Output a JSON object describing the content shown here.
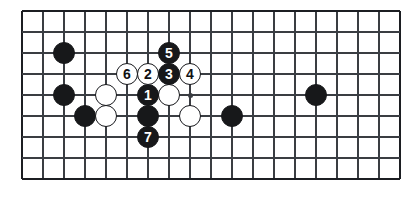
{
  "figure": {
    "kind": "go-board-diagram",
    "background_color": "#ffffff",
    "line_color": "#3a3d42",
    "border_color": "#1c1e22",
    "black_stone_color": "#17181a",
    "white_stone_color": "#ffffff",
    "black_number_color": "#ffffff",
    "white_number_color": "#101114"
  },
  "board": {
    "columns": 19,
    "rows": 9,
    "origin_x": 22,
    "origin_y": 11,
    "spacing": 21,
    "stone_diameter": 22,
    "star_points": [
      {
        "col": 9,
        "row": 5
      }
    ]
  },
  "stones": [
    {
      "id": "stone-black-a",
      "color": "black",
      "col": 3,
      "row": 3,
      "label": ""
    },
    {
      "id": "stone-black-b",
      "color": "black",
      "col": 3,
      "row": 5,
      "label": ""
    },
    {
      "id": "stone-black-c",
      "color": "black",
      "col": 4,
      "row": 6,
      "label": ""
    },
    {
      "id": "stone-white-a",
      "color": "white",
      "col": 5,
      "row": 5,
      "label": ""
    },
    {
      "id": "stone-white-b",
      "color": "white",
      "col": 5,
      "row": 6,
      "label": ""
    },
    {
      "id": "stone-white-c",
      "color": "white",
      "col": 8,
      "row": 5,
      "label": ""
    },
    {
      "id": "stone-white-d",
      "color": "white",
      "col": 9,
      "row": 6,
      "label": ""
    },
    {
      "id": "stone-black-d",
      "color": "black",
      "col": 7,
      "row": 6,
      "label": ""
    },
    {
      "id": "stone-black-e",
      "color": "black",
      "col": 11,
      "row": 6,
      "label": ""
    },
    {
      "id": "stone-black-f",
      "color": "black",
      "col": 15,
      "row": 5,
      "label": ""
    },
    {
      "id": "move-1",
      "color": "black",
      "col": 7,
      "row": 5,
      "label": "1"
    },
    {
      "id": "move-2",
      "color": "white",
      "col": 7,
      "row": 4,
      "label": "2"
    },
    {
      "id": "move-3",
      "color": "black",
      "col": 8,
      "row": 4,
      "label": "3"
    },
    {
      "id": "move-4",
      "color": "white",
      "col": 9,
      "row": 4,
      "label": "4"
    },
    {
      "id": "move-5",
      "color": "black",
      "col": 8,
      "row": 3,
      "label": "5"
    },
    {
      "id": "move-6",
      "color": "white",
      "col": 6,
      "row": 4,
      "label": "6"
    },
    {
      "id": "move-7",
      "color": "black",
      "col": 7,
      "row": 7,
      "label": "7"
    }
  ],
  "move_sequence": {
    "moves": [
      "1",
      "2",
      "3",
      "4",
      "5",
      "6",
      "7"
    ],
    "count": 7
  }
}
